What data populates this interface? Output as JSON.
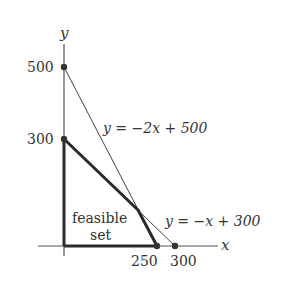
{
  "diagram": {
    "axis_labels": {
      "x": "x",
      "y": "y"
    },
    "y_ticks": [
      {
        "value": 500,
        "label": "500"
      },
      {
        "value": 300,
        "label": "300"
      }
    ],
    "x_ticks": [
      {
        "value": 250,
        "label": "250"
      },
      {
        "value": 300,
        "label": "300"
      }
    ],
    "lines": [
      {
        "name": "line-2x",
        "label": "y = −2x + 500",
        "from": [
          0,
          500
        ],
        "to": [
          250,
          0
        ]
      },
      {
        "name": "line-x",
        "label": "y = −x + 300",
        "from": [
          0,
          300
        ],
        "to": [
          300,
          0
        ]
      }
    ],
    "region": {
      "label_line1": "feasible",
      "label_line2": "set",
      "vertices": [
        [
          0,
          0
        ],
        [
          0,
          300
        ],
        [
          200,
          100
        ],
        [
          250,
          0
        ]
      ]
    },
    "points": [
      [
        0,
        500
      ],
      [
        0,
        300
      ],
      [
        250,
        0
      ],
      [
        300,
        0
      ]
    ],
    "colors": {
      "ink": "#333333",
      "bold": "#2a2a2a"
    }
  }
}
